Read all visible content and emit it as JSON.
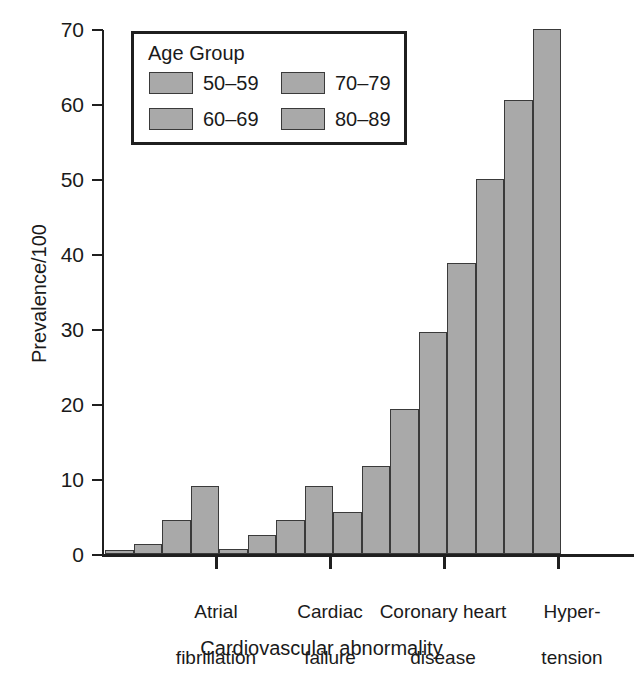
{
  "chart_data": {
    "type": "bar",
    "title": "",
    "subtitle": "",
    "xlabel": "Cardiovascular abnormality",
    "ylabel": "Prevalence/100",
    "categories": [
      "Atrial fibrillation",
      "Cardiac failure",
      "Coronary heart disease",
      "Hypertension"
    ],
    "category_lines": [
      [
        "Atrial",
        "fibrillation"
      ],
      [
        "Cardiac",
        "failure"
      ],
      [
        "Coronary heart",
        "disease"
      ],
      [
        "Hyper-",
        "tension"
      ]
    ],
    "series": [
      {
        "name": "50–59",
        "values": [
          0.5,
          0.7,
          5.6,
          38.8
        ],
        "color": "#a9a9a9"
      },
      {
        "name": "60–69",
        "values": [
          1.4,
          2.5,
          11.8,
          50.0
        ],
        "color": "#a9a9a9"
      },
      {
        "name": "70–79",
        "values": [
          4.6,
          4.6,
          19.4,
          60.6
        ],
        "color": "#a9a9a9"
      },
      {
        "name": "80–89",
        "values": [
          9.1,
          9.1,
          29.6,
          70.0
        ],
        "color": "#a9a9a9"
      }
    ],
    "ylim": [
      0,
      70
    ],
    "yticks": [
      0,
      10,
      20,
      30,
      40,
      50,
      60,
      70
    ],
    "ytick_labels": [
      "0",
      "10",
      "20",
      "30",
      "40",
      "50",
      "60",
      "70"
    ],
    "grid": false,
    "legend_position": "top-left",
    "legend_title": "Age Group",
    "bar_edge_color": "#3a3a3a",
    "axis_color": "#1f1f1f"
  },
  "legend": {
    "title": "Age Group",
    "entries": [
      {
        "label": "50–59",
        "swatch_name": "legend-swatch-50-59"
      },
      {
        "label": "70–79",
        "swatch_name": "legend-swatch-70-79"
      },
      {
        "label": "60–69",
        "swatch_name": "legend-swatch-60-69"
      },
      {
        "label": "80–89",
        "swatch_name": "legend-swatch-80-89"
      }
    ]
  },
  "axes": {
    "y_title": "Prevalence/100",
    "x_title": "Cardiovascular abnormality",
    "y_labels": [
      "70",
      "60",
      "50",
      "40",
      "30",
      "20",
      "10",
      "0"
    ]
  },
  "x_labels": [
    {
      "line1": "Atrial",
      "line2": "fibrillation"
    },
    {
      "line1": "Cardiac",
      "line2": "failure"
    },
    {
      "line1": "Coronary heart",
      "line2": "disease"
    },
    {
      "line1": "Hyper-",
      "line2": "tension"
    }
  ]
}
